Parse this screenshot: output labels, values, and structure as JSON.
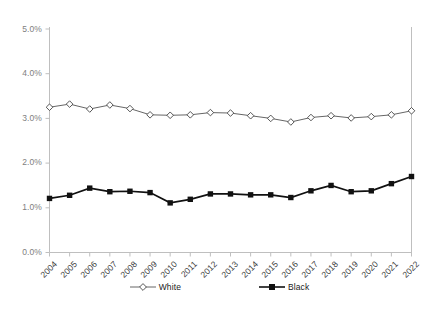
{
  "chart_data": {
    "type": "line",
    "title": "",
    "subtitle": "",
    "xlabel": "",
    "ylabel": "",
    "x": [
      "2004",
      "2005",
      "2006",
      "2007",
      "2008",
      "2009",
      "2010",
      "2011",
      "2012",
      "2013",
      "2014",
      "2015",
      "2016",
      "2017",
      "2018",
      "2019",
      "2020",
      "2021",
      "2022"
    ],
    "categories": [
      "2004",
      "2005",
      "2006",
      "2007",
      "2008",
      "2009",
      "2010",
      "2011",
      "2012",
      "2013",
      "2014",
      "2015",
      "2016",
      "2017",
      "2018",
      "2019",
      "2020",
      "2021",
      "2022"
    ],
    "series": [
      {
        "name": "White",
        "marker": "open-diamond",
        "color": "#555555",
        "values": [
          3.25,
          3.32,
          3.21,
          3.3,
          3.22,
          3.08,
          3.07,
          3.08,
          3.13,
          3.12,
          3.06,
          3.0,
          2.92,
          3.02,
          3.06,
          3.01,
          3.04,
          3.08,
          3.17
        ]
      },
      {
        "name": "Black",
        "marker": "filled-square",
        "color": "#111111",
        "values": [
          1.21,
          1.28,
          1.44,
          1.36,
          1.37,
          1.34,
          1.11,
          1.19,
          1.31,
          1.31,
          1.29,
          1.29,
          1.23,
          1.38,
          1.5,
          1.36,
          1.38,
          1.54,
          1.7
        ]
      }
    ],
    "ylim": [
      0.0,
      5.0
    ],
    "ytick_values": [
      0.0,
      1.0,
      2.0,
      3.0,
      4.0,
      5.0
    ],
    "ytick_labels": [
      "0.0%",
      "1.0%",
      "2.0%",
      "3.0%",
      "4.0%",
      "5.0%"
    ],
    "grid": false,
    "legend_position": "bottom-center",
    "axis_color": "#bfbfbf",
    "background": "#ffffff"
  },
  "legend": {
    "items": [
      {
        "label": "White",
        "marker": "open-diamond-marker"
      },
      {
        "label": "Black",
        "marker": "filled-square-marker"
      }
    ]
  }
}
